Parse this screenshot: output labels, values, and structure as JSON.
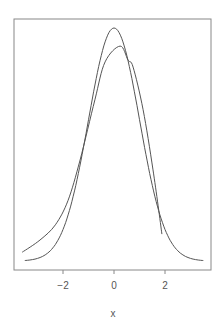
{
  "chart_data": {
    "type": "line",
    "title": "",
    "xlabel": "x",
    "ylabel": "",
    "xlim": [
      -3.85,
      3.85
    ],
    "ylim": [
      0,
      0.415
    ],
    "grid": false,
    "legend": null,
    "x_ticks": [
      -2,
      0,
      2
    ],
    "x_tick_labels": [
      "−2",
      "0",
      "2"
    ],
    "y_axis_visible": false,
    "series": [
      {
        "name": "normal-density",
        "color": "#555555",
        "x": [
          -3.5,
          -3.0,
          -2.5,
          -2.0,
          -1.5,
          -1.0,
          -0.5,
          0.0,
          0.5,
          1.0,
          1.5,
          2.0,
          2.5,
          3.0,
          3.5
        ],
        "y": [
          0.0009,
          0.0044,
          0.0175,
          0.054,
          0.1295,
          0.242,
          0.352,
          0.399,
          0.352,
          0.242,
          0.1295,
          0.054,
          0.0175,
          0.0044,
          0.0009
        ]
      },
      {
        "name": "empirical-density",
        "color": "#555555",
        "x": [
          -3.6,
          -2.9,
          -2.3,
          -1.8,
          -1.33,
          -0.75,
          -0.35,
          0.24,
          0.55,
          0.75,
          1.14,
          1.53,
          1.88
        ],
        "y": [
          0.015,
          0.036,
          0.062,
          0.104,
          0.173,
          0.276,
          0.341,
          0.368,
          0.344,
          0.332,
          0.259,
          0.156,
          0.046
        ]
      }
    ]
  },
  "colors": {
    "axis": "#888888",
    "line": "#555555",
    "background": "#ffffff"
  }
}
